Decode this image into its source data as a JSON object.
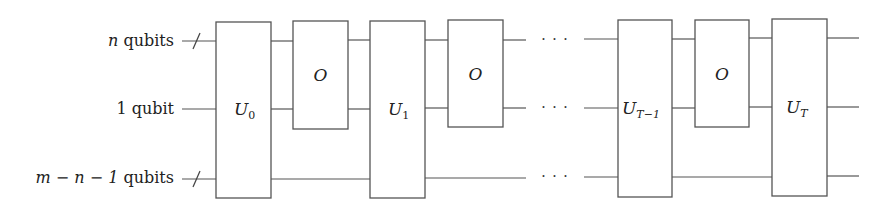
{
  "diagram": {
    "type": "quantum-circuit",
    "registers": [
      {
        "id": "reg-top",
        "label_var": "n",
        "label_rest": " qubits",
        "multi": true,
        "y": 40
      },
      {
        "id": "reg-mid",
        "label_var": "",
        "label_rest": "1 qubit",
        "multi": false,
        "y": 108
      },
      {
        "id": "reg-bot",
        "label_var": "m − n − 1",
        "label_rest": " qubits",
        "multi": true,
        "y": 177
      }
    ],
    "gates": [
      {
        "id": "U0",
        "name": "U",
        "sub": "0",
        "spans": [
          "reg-top",
          "reg-mid",
          "reg-bot"
        ]
      },
      {
        "id": "O1",
        "name": "O",
        "sub": "",
        "spans": [
          "reg-top",
          "reg-mid"
        ]
      },
      {
        "id": "U1",
        "name": "U",
        "sub": "1",
        "spans": [
          "reg-top",
          "reg-mid",
          "reg-bot"
        ]
      },
      {
        "id": "O2",
        "name": "O",
        "sub": "",
        "spans": [
          "reg-top",
          "reg-mid"
        ]
      },
      {
        "id": "UT-1",
        "name": "U",
        "sub": "T−1",
        "spans": [
          "reg-top",
          "reg-mid",
          "reg-bot"
        ]
      },
      {
        "id": "O3",
        "name": "O",
        "sub": "",
        "spans": [
          "reg-top",
          "reg-mid"
        ]
      },
      {
        "id": "UT",
        "name": "U",
        "sub": "T",
        "spans": [
          "reg-top",
          "reg-mid",
          "reg-bot"
        ]
      }
    ],
    "ellipsis": "· · ·",
    "colors": {
      "line": "#555555",
      "text": "#222222",
      "background": "#ffffff"
    }
  }
}
